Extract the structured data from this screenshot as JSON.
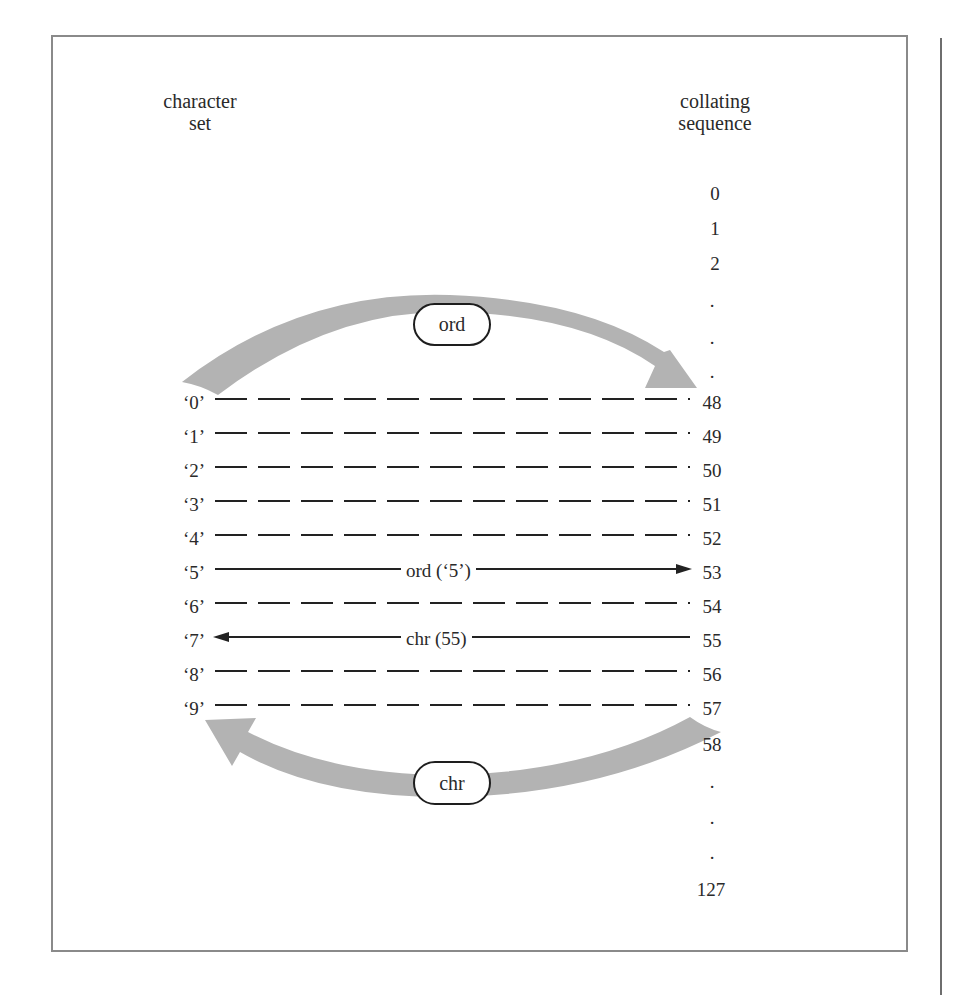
{
  "headings": {
    "left": [
      "character",
      "set"
    ],
    "right": [
      "collating",
      "sequence"
    ]
  },
  "sequence_top": [
    "0",
    "1",
    "2",
    ".",
    ".",
    "."
  ],
  "rows": [
    {
      "char": "‘0’",
      "code": "48",
      "style": "dashed"
    },
    {
      "char": "‘1’",
      "code": "49",
      "style": "dashed"
    },
    {
      "char": "‘2’",
      "code": "50",
      "style": "dashed"
    },
    {
      "char": "‘3’",
      "code": "51",
      "style": "dashed"
    },
    {
      "char": "‘4’",
      "code": "52",
      "style": "dashed"
    },
    {
      "char": "‘5’",
      "code": "53",
      "style": "arrow-right",
      "label": "ord (‘5’)"
    },
    {
      "char": "‘6’",
      "code": "54",
      "style": "dashed"
    },
    {
      "char": "‘7’",
      "code": "55",
      "style": "arrow-left",
      "label": "chr (55)"
    },
    {
      "char": "‘8’",
      "code": "56",
      "style": "dashed"
    },
    {
      "char": "‘9’",
      "code": "57",
      "style": "dashed"
    }
  ],
  "sequence_bottom": [
    "58",
    ".",
    ".",
    ".",
    "127"
  ],
  "arcs": {
    "top": {
      "label": "ord",
      "direction": "char-to-code"
    },
    "bottom": {
      "label": "chr",
      "direction": "code-to-char"
    }
  },
  "colors": {
    "band": "#b3b3b3",
    "ink": "#222222",
    "frame": "#8a8a8a"
  }
}
